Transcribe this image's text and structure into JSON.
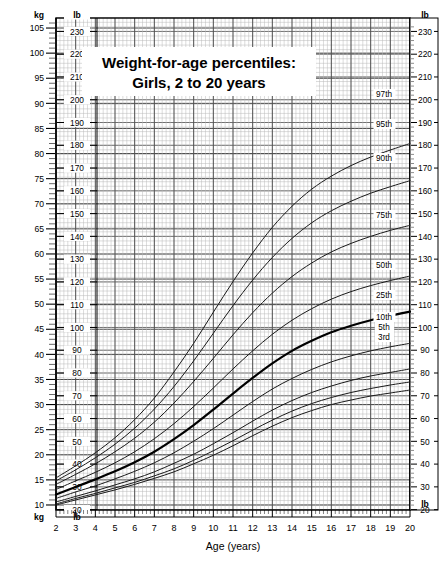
{
  "title": {
    "line1": "Weight-for-age percentiles:",
    "line2": "Girls, 2 to 20 years"
  },
  "axes": {
    "x_label": "Age (years)",
    "x_ticks": [
      "2",
      "3",
      "4",
      "5",
      "6",
      "7",
      "8",
      "9",
      "10",
      "11",
      "12",
      "13",
      "14",
      "15",
      "16",
      "17",
      "18",
      "19",
      "20"
    ],
    "left_unit_top": "kg",
    "left_unit_top_2": "lb",
    "left_unit_bottom": "kg",
    "left_unit_bottom_2": "lb",
    "right_unit_top": "lb",
    "right_unit_bottom": "lb",
    "kg_ticks": [
      "105",
      "100",
      "95",
      "90",
      "85",
      "80",
      "75",
      "70",
      "65",
      "60",
      "55",
      "50",
      "45",
      "40",
      "35",
      "30",
      "25",
      "20",
      "15",
      "10"
    ],
    "lb_ticks": [
      "230",
      "220",
      "210",
      "200",
      "190",
      "180",
      "170",
      "160",
      "150",
      "140",
      "130",
      "120",
      "110",
      "100",
      "90",
      "80",
      "70",
      "60",
      "50",
      "40",
      "30",
      "20"
    ],
    "right_lb_ticks": [
      "230",
      "220",
      "210",
      "200",
      "190",
      "180",
      "170",
      "160",
      "150",
      "140",
      "130",
      "120",
      "110",
      "100",
      "90",
      "80",
      "70",
      "60",
      "50",
      "40",
      "30",
      "20"
    ]
  },
  "percentile_labels": [
    "97th",
    "95th",
    "90th",
    "75th",
    "50th",
    "25th",
    "10th",
    "5th",
    "3rd"
  ],
  "colors": {
    "ink": "#000000",
    "grid_minor": "#b9b9b9",
    "grid_major": "#444444",
    "curve": "#1a1a1a",
    "curve_bold": "#000000"
  },
  "chart_data": {
    "type": "line",
    "xlabel": "Age (years)",
    "ylabel": "Weight (kg / lb)",
    "xlim": [
      2,
      20
    ],
    "ylim": [
      9,
      107
    ],
    "y_unit_primary": "kg",
    "y_unit_secondary": "lb",
    "grid": true,
    "legend": "right-edge-inline-labels",
    "x": [
      2,
      3,
      4,
      5,
      6,
      7,
      8,
      9,
      10,
      11,
      12,
      13,
      14,
      15,
      16,
      17,
      18,
      19,
      20
    ],
    "series": [
      {
        "name": "97th",
        "values": [
          15.4,
          17.8,
          20.4,
          23.4,
          27.0,
          31.3,
          36.5,
          42.2,
          48.4,
          54.5,
          60.2,
          65.3,
          69.5,
          72.9,
          75.5,
          77.6,
          79.3,
          80.7,
          82.0
        ],
        "bold": false
      },
      {
        "name": "95th",
        "values": [
          14.8,
          17.0,
          19.4,
          22.1,
          25.3,
          29.1,
          33.6,
          38.7,
          44.2,
          49.7,
          54.8,
          59.3,
          63.1,
          66.2,
          68.6,
          70.5,
          72.1,
          73.4,
          74.6
        ],
        "bold": false
      },
      {
        "name": "90th",
        "values": [
          14.1,
          16.1,
          18.2,
          20.6,
          23.3,
          26.5,
          30.3,
          34.6,
          39.2,
          43.9,
          48.3,
          52.2,
          55.5,
          58.2,
          60.4,
          62.1,
          63.5,
          64.7,
          65.7
        ],
        "bold": false
      },
      {
        "name": "75th",
        "values": [
          13.1,
          14.8,
          16.5,
          18.4,
          20.6,
          23.2,
          26.2,
          29.6,
          33.3,
          37.1,
          40.7,
          44.0,
          46.8,
          49.1,
          51.0,
          52.5,
          53.7,
          54.7,
          55.6
        ],
        "bold": false
      },
      {
        "name": "50th",
        "values": [
          12.1,
          13.6,
          15.1,
          16.7,
          18.5,
          20.6,
          23.1,
          25.9,
          29.0,
          32.2,
          35.3,
          38.2,
          40.7,
          42.7,
          44.4,
          45.7,
          46.8,
          47.7,
          48.5
        ],
        "bold": true
      },
      {
        "name": "25th",
        "values": [
          11.3,
          12.6,
          13.8,
          15.2,
          16.7,
          18.4,
          20.4,
          22.7,
          25.2,
          27.9,
          30.6,
          33.1,
          35.2,
          37.0,
          38.5,
          39.7,
          40.7,
          41.5,
          42.2
        ],
        "bold": false
      },
      {
        "name": "10th",
        "values": [
          10.6,
          11.7,
          12.8,
          14.0,
          15.2,
          16.6,
          18.3,
          20.1,
          22.2,
          24.4,
          26.7,
          28.9,
          30.8,
          32.4,
          33.7,
          34.8,
          35.7,
          36.4,
          37.1
        ],
        "bold": false
      },
      {
        "name": "5th",
        "values": [
          10.2,
          11.3,
          12.3,
          13.4,
          14.5,
          15.8,
          17.2,
          18.9,
          20.8,
          22.8,
          24.9,
          26.9,
          28.7,
          30.2,
          31.4,
          32.4,
          33.2,
          33.9,
          34.5
        ],
        "bold": false
      },
      {
        "name": "3rd",
        "values": [
          10.0,
          11.0,
          12.0,
          13.0,
          14.1,
          15.3,
          16.6,
          18.2,
          19.9,
          21.8,
          23.8,
          25.7,
          27.4,
          28.8,
          30.0,
          30.9,
          31.7,
          32.3,
          32.9
        ],
        "bold": false
      }
    ]
  }
}
